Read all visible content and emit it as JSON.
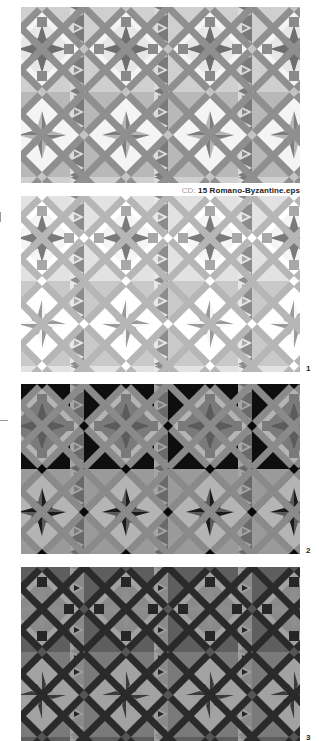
{
  "caption": {
    "prefix": "CD:",
    "filename": "15 Romano-Byzantine.eps"
  },
  "panels": [
    {
      "label": "",
      "colors": {
        "bg": "#cfcfcf",
        "bgAlt": "#b8b8b8",
        "band": "#8f8f8f",
        "star": "#6e6e6e",
        "square": "#8a8a8a",
        "light": "#f4f4f4",
        "strip": "#7a7a7a",
        "pinA": "#7d7d7d",
        "pinB": "#b5b5b5",
        "node": "#c4c4c4"
      }
    },
    {
      "label": "1",
      "colors": {
        "bg": "#e2e2e2",
        "bgAlt": "#c9c9c9",
        "band": "#b6b6b6",
        "star": "#7a7a7a",
        "square": "#a8a8a8",
        "light": "#ffffff",
        "strip": "#8c8c8c",
        "pinA": "#f6f6f6",
        "pinB": "#9a9a9a",
        "node": "#ffffff"
      }
    },
    {
      "label": "2",
      "colors": {
        "bg": "#0e0e0e",
        "bgAlt": "#9a9a9a",
        "band": "#8a8a8a",
        "star": "#5c5c5c",
        "square": "#7a7a7a",
        "light": "#b4b4b4",
        "strip": "#6a6a6a",
        "pinA": "#1a1a1a",
        "pinB": "#5a5a5a",
        "node": "#0a0a0a"
      }
    },
    {
      "label": "3",
      "colors": {
        "bg": "#5e5e5e",
        "bgAlt": "#7a7a7a",
        "band": "#2a2a2a",
        "star": "#8e8e8e",
        "square": "#262626",
        "light": "#a2a2a2",
        "strip": "#8a8a8a",
        "pinA": "#3a3a3a",
        "pinB": "#9c9c9c",
        "node": "#555555"
      }
    }
  ],
  "plate_numbers": [
    "1",
    "2",
    "3"
  ]
}
